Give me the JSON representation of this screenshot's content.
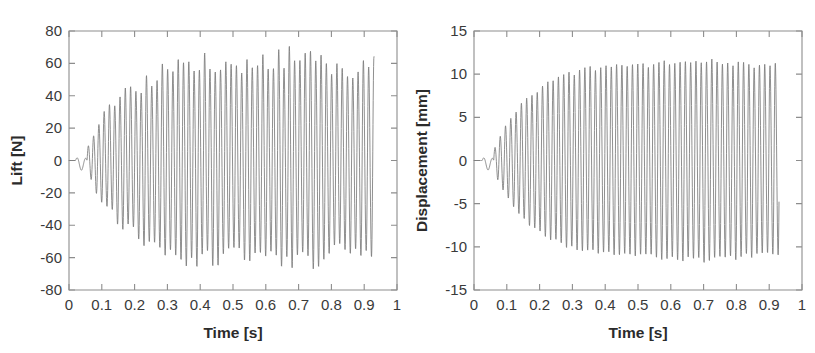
{
  "figure": {
    "name": "lift-and-displacement-time-histories",
    "background_color": "#ffffff",
    "trace_color": "#7b7b7b",
    "axis_color": "#8d8d8d",
    "text_color": "#2b2b2b"
  },
  "chart_data": [
    {
      "type": "line",
      "name": "lift-time-history",
      "title": "",
      "xlabel": "Time [s]",
      "ylabel": "Lift [N]",
      "xlim": [
        0,
        1
      ],
      "ylim": [
        -80,
        80
      ],
      "grid": false,
      "legend": null,
      "xticks": [
        0,
        0.1,
        0.2,
        0.3,
        0.4,
        0.5,
        0.6,
        0.7,
        0.8,
        0.9,
        1
      ],
      "xticklabels": [
        "0",
        "0.1",
        "0.2",
        "0.3",
        "0.4",
        "0.5",
        "0.6",
        "0.7",
        "0.8",
        "0.9",
        "1"
      ],
      "yticks": [
        80,
        60,
        40,
        20,
        0,
        -20,
        -40,
        -60,
        -80
      ],
      "yticklabels": [
        "80",
        "60",
        "40",
        "20",
        "0",
        "-20",
        "-40",
        "-60",
        "-80"
      ],
      "signal": {
        "description": "Aeroelastic flutter response: quiescent start, small transient near t=0.04 s, exponentially growing oscillation that saturates into a limit cycle of about +-60 N; record ends at t=0.93 s",
        "t_start": 0.0,
        "t_end": 0.93,
        "frequency_hz": 62,
        "quiet_until": 0.02,
        "transient_bump_time": 0.042,
        "transient_bump_amplitude": 6,
        "growth_start": 0.055,
        "growth_rate": 9.5,
        "saturation_time": 0.47,
        "limit_cycle_amplitude": 60,
        "peak_positive": 65,
        "peak_negative": -71,
        "envelope_jitter": 0.13,
        "peak_jitter": 0.11
      }
    },
    {
      "type": "line",
      "name": "displacement-time-history",
      "title": "",
      "xlabel": "Time [s]",
      "ylabel": "Displacement [mm]",
      "xlim": [
        0,
        1
      ],
      "ylim": [
        -15,
        15
      ],
      "grid": false,
      "legend": null,
      "xticks": [
        0,
        0.1,
        0.2,
        0.3,
        0.4,
        0.5,
        0.6,
        0.7,
        0.8,
        0.9,
        1
      ],
      "xticklabels": [
        "0",
        "0.1",
        "0.2",
        "0.3",
        "0.4",
        "0.5",
        "0.6",
        "0.7",
        "0.8",
        "0.9",
        "1"
      ],
      "yticks": [
        15,
        10,
        5,
        0,
        -5,
        -10,
        -15
      ],
      "yticklabels": [
        "15",
        "10",
        "5",
        "0",
        "-5",
        "-10",
        "-15"
      ],
      "signal": {
        "description": "Structural displacement flutter response: quiescent start, small transient near t=0.05 s, exponentially growing oscillation saturating into a smooth limit cycle of about +-11 mm; record ends at t=0.93 s",
        "t_start": 0.0,
        "t_end": 0.93,
        "frequency_hz": 62,
        "quiet_until": 0.025,
        "transient_bump_time": 0.048,
        "transient_bump_amplitude": 1.1,
        "growth_start": 0.06,
        "growth_rate": 9.0,
        "saturation_time": 0.5,
        "limit_cycle_amplitude": 11.2,
        "peak_positive": 11.4,
        "peak_negative": -11.6,
        "envelope_jitter": 0.03,
        "peak_jitter": 0.03
      }
    }
  ]
}
